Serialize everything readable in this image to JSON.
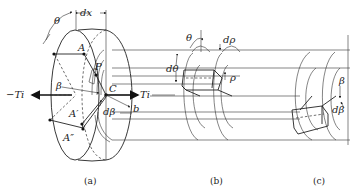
{
  "figure": {
    "panels": [
      {
        "id": "a",
        "caption": "(a)"
      },
      {
        "id": "b",
        "caption": "(b)"
      },
      {
        "id": "c",
        "caption": "(c)"
      }
    ],
    "labels_a": {
      "theta": "θ",
      "dx": "dx",
      "A": "A",
      "P": "P",
      "C": "C",
      "neg_torque": "−Ti",
      "pos_torque": "Ti",
      "beta": "β",
      "A_prime": "A′",
      "A_double_prime": "A″",
      "d_beta": "dβ",
      "b": "b"
    },
    "labels_b": {
      "theta": "θ",
      "d_rho": "dρ",
      "d_theta": "dθ",
      "rho": "ρ"
    },
    "labels_c": {
      "beta": "β",
      "d_beta": "dβ"
    }
  }
}
